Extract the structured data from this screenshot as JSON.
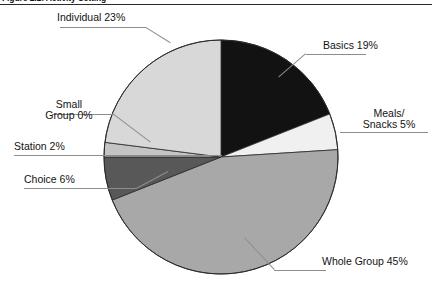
{
  "figure": {
    "title": "Figure 2.1: Activity Setting",
    "title_rule": true
  },
  "labels": {
    "individual": "Individual 23%",
    "basics": "Basics 19%",
    "meals_line1": "Meals/",
    "meals_line2": "Snacks 5%",
    "small_line1": "Small",
    "small_line2": "Group 0%",
    "station": "Station 2%",
    "choice": "Choice 6%",
    "whole": "Whole Group 45%"
  },
  "chart_data": {
    "type": "pie",
    "title": "Figure 2.1: Activity Setting",
    "xlabel": "",
    "ylabel": "",
    "grid": false,
    "legend": "none (direct labels with leader lines)",
    "start_angle_deg": 0,
    "direction": "clockwise",
    "center": {
      "x": 221,
      "y": 157
    },
    "radius": 117,
    "outline_color": "#2b2b2b",
    "categories": [
      "Basics",
      "Meals/Snacks",
      "Whole Group",
      "Choice",
      "Station",
      "Small Group",
      "Individual"
    ],
    "values": [
      19,
      5,
      45,
      6,
      2,
      0,
      23
    ],
    "units": "percent",
    "total": 100,
    "slices": [
      {
        "name": "Basics",
        "value": 19,
        "label": "Basics 19%",
        "color": "#121212",
        "label_position": "right-top"
      },
      {
        "name": "Meals/Snacks",
        "value": 5,
        "label": "Meals/Snacks 5%",
        "color": "#f0f0f0",
        "label_position": "right"
      },
      {
        "name": "Whole Group",
        "value": 45,
        "label": "Whole Group 45%",
        "color": "#a8a8a8",
        "label_position": "right-bottom"
      },
      {
        "name": "Choice",
        "value": 6,
        "label": "Choice 6%",
        "color": "#585858",
        "label_position": "left"
      },
      {
        "name": "Station",
        "value": 2,
        "label": "Station 2%",
        "color": "#c4c4c4",
        "label_position": "left"
      },
      {
        "name": "Small Group",
        "value": 0,
        "label": "Small Group 0%",
        "color": "#d8d8d8",
        "label_position": "left-top"
      },
      {
        "name": "Individual",
        "value": 23,
        "label": "Individual 23%",
        "color": "#d8d8d8",
        "label_position": "top-left"
      }
    ]
  }
}
